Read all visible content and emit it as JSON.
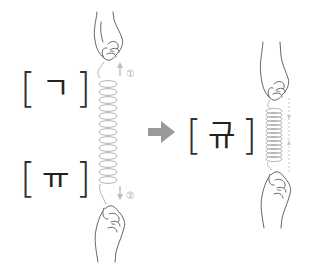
{
  "diagram": {
    "left_top": {
      "open_bracket": "[",
      "jamo": "ㄱ",
      "close_bracket": "]"
    },
    "left_bottom": {
      "open_bracket": "[",
      "jamo": "ㅠ",
      "close_bracket": "]"
    },
    "result": {
      "open_bracket": "[",
      "syllable": "규",
      "close_bracket": "]"
    },
    "labels": {
      "step1": "①",
      "step2": "②"
    },
    "colors": {
      "arrow": "#999999",
      "spring": "#b5b5b5",
      "hand_outline": "#555555",
      "text": "#222222",
      "step_label": "#aaaaaa"
    },
    "icons": {
      "transform_arrow": "right-arrow",
      "hand": "hand-grip",
      "spring": "coil-spring"
    }
  }
}
